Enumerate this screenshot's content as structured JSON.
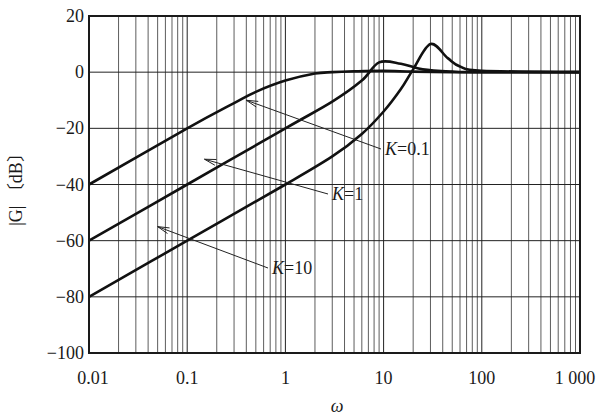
{
  "chart_data": {
    "type": "line",
    "title": "",
    "xlabel": "ω",
    "ylabel": "|G| 〔dB〕",
    "xscale": "log",
    "xlim": [
      0.01,
      1000
    ],
    "ylim": [
      -100,
      20
    ],
    "x_ticks": [
      0.01,
      0.1,
      1,
      10,
      100,
      1000
    ],
    "x_tick_labels": [
      "0.01",
      "0.1",
      "1",
      "10",
      "100",
      "1 000"
    ],
    "y_ticks": [
      20,
      0,
      -20,
      -40,
      -60,
      -80,
      -100
    ],
    "y_tick_labels": [
      "20",
      "0",
      "−20",
      "−40",
      "−60",
      "−80",
      "−100"
    ],
    "grid": {
      "major_x": true,
      "minor_x": true,
      "major_y": true
    },
    "legend": "none (inline annotations with arrows)",
    "series": [
      {
        "name": "K=0.1",
        "x": [
          0.01,
          0.1,
          0.3,
          0.5,
          1,
          2,
          3,
          5,
          10,
          20,
          50,
          100,
          1000
        ],
        "y": [
          -40,
          -20,
          -11,
          -7,
          -3,
          -0.5,
          0,
          0.3,
          0.5,
          0.2,
          0,
          0,
          0
        ]
      },
      {
        "name": "K=1",
        "x": [
          0.01,
          0.1,
          1,
          3,
          6,
          9,
          15,
          25,
          50,
          100,
          1000
        ],
        "y": [
          -60,
          -40,
          -20,
          -10.5,
          -3,
          3.5,
          3,
          1,
          0.2,
          0,
          0
        ]
      },
      {
        "name": "K=10",
        "x": [
          0.01,
          0.1,
          1,
          3,
          6,
          10,
          15,
          20,
          30,
          45,
          60,
          100,
          1000
        ],
        "y": [
          -80,
          -60,
          -40,
          -30,
          -22,
          -14,
          -6,
          1,
          10,
          5,
          2,
          0.5,
          0
        ]
      }
    ],
    "annotations": [
      {
        "text": "K=0.1",
        "k": "K",
        "eq": "=0.1",
        "label_pos": [
          385,
          155
        ],
        "arrow_to": [
          0.4,
          -10
        ]
      },
      {
        "text": "K=1",
        "k": "K",
        "eq": "=1",
        "label_pos": [
          332,
          200
        ],
        "arrow_to": [
          0.15,
          -31
        ]
      },
      {
        "text": "K=10",
        "k": "K",
        "eq": "=10",
        "label_pos": [
          272,
          274
        ],
        "arrow_to": [
          0.05,
          -55
        ]
      }
    ]
  }
}
